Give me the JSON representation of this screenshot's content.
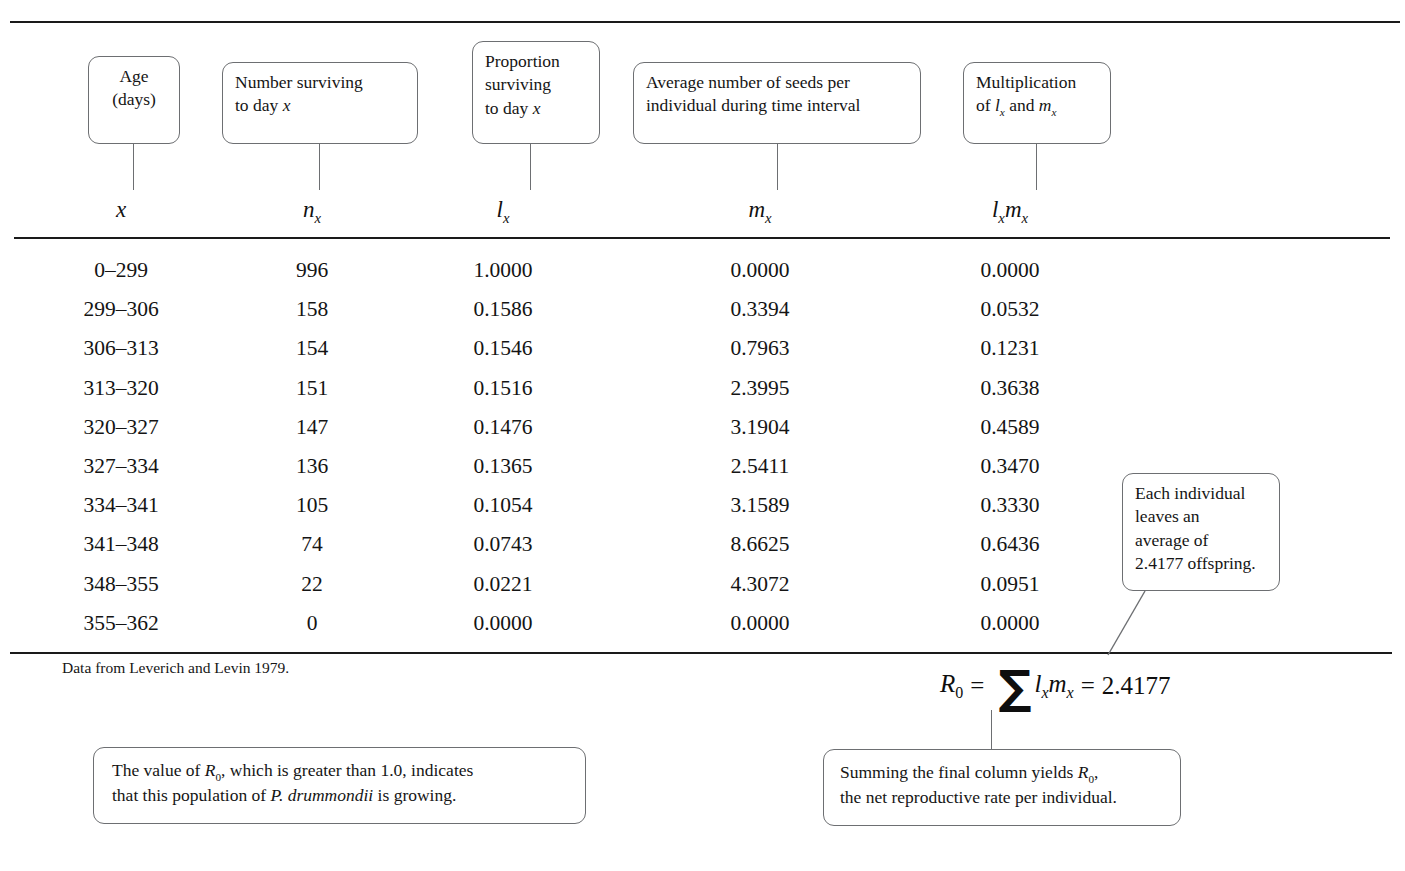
{
  "figure": {
    "title_symbols": [
      "x",
      "n",
      "l",
      "m",
      "lm"
    ],
    "footnote": "Data from Leverich and Levin 1979."
  },
  "header_callouts": [
    {
      "id": "age",
      "lines": [
        "Age",
        "(days)"
      ]
    },
    {
      "id": "number-surviving",
      "lines": [
        "Number surviving",
        "to day x"
      ]
    },
    {
      "id": "proportion-surviving",
      "lines": [
        "Proportion",
        "surviving",
        "to day x"
      ]
    },
    {
      "id": "average-seeds",
      "lines": [
        "Average number of seeds per",
        "individual during time interval"
      ]
    },
    {
      "id": "multiplication",
      "lines": [
        "Multiplication",
        "of lx and mx"
      ]
    }
  ],
  "column_symbols": {
    "age": "x",
    "n_x": "nx",
    "l_x": "lx",
    "m_x": "mx",
    "lm_x": "lxmx"
  },
  "table": {
    "columns": [
      "x",
      "n_x",
      "l_x",
      "m_x",
      "l_x m_x"
    ],
    "rows": [
      {
        "x": "0–299",
        "nx": "996",
        "lx": "1.0000",
        "mx": "0.0000",
        "lxmx": "0.0000"
      },
      {
        "x": "299–306",
        "nx": "158",
        "lx": "0.1586",
        "mx": "0.3394",
        "lxmx": "0.0532"
      },
      {
        "x": "306–313",
        "nx": "154",
        "lx": "0.1546",
        "mx": "0.7963",
        "lxmx": "0.1231"
      },
      {
        "x": "313–320",
        "nx": "151",
        "lx": "0.1516",
        "mx": "2.3995",
        "lxmx": "0.3638"
      },
      {
        "x": "320–327",
        "nx": "147",
        "lx": "0.1476",
        "mx": "3.1904",
        "lxmx": "0.4589"
      },
      {
        "x": "327–334",
        "nx": "136",
        "lx": "0.1365",
        "mx": "2.5411",
        "lxmx": "0.3470"
      },
      {
        "x": "334–341",
        "nx": "105",
        "lx": "0.1054",
        "mx": "3.1589",
        "lxmx": "0.3330"
      },
      {
        "x": "341–348",
        "nx": "74",
        "lx": "0.0743",
        "mx": "8.6625",
        "lxmx": "0.6436"
      },
      {
        "x": "348–355",
        "nx": "22",
        "lx": "0.0221",
        "mx": "4.3072",
        "lxmx": "0.0951"
      },
      {
        "x": "355–362",
        "nx": "0",
        "lx": "0.0000",
        "mx": "0.0000",
        "lxmx": "0.0000"
      }
    ]
  },
  "formula": {
    "lhs": "R",
    "lhs_sub": "0",
    "eq1": "=",
    "sigma": "∑",
    "term": "lxmx",
    "eq2": "=",
    "result": "2.4177"
  },
  "annotation_callouts": [
    {
      "id": "offspring-note",
      "lines": [
        "Each individual",
        "leaves an",
        "average of",
        "2.4177 offspring."
      ]
    },
    {
      "id": "growth-note",
      "line1_a": "The value of ",
      "line1_R": "R",
      "line1_sub": "0",
      "line1_b": ", which is greater than 1.0, indicates",
      "line2_a": "that this population of ",
      "line2_species": "P. drummondii",
      "line2_b": " is growing."
    },
    {
      "id": "summing-note",
      "line1_a": "Summing the final column yields ",
      "line1_R": "R",
      "line1_sub": "0",
      "line1_b": ",",
      "line2": "the net reproductive rate per individual."
    }
  ]
}
